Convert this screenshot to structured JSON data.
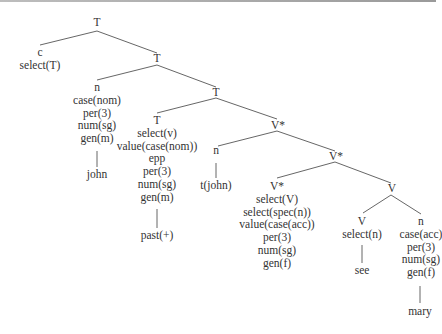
{
  "diagram": {
    "type": "syntax-tree",
    "nodes": {
      "root": {
        "label": "T"
      },
      "c": {
        "lines": [
          "c",
          "select(T)"
        ]
      },
      "t2": {
        "label": "T"
      },
      "n_subj": {
        "lines": [
          "n",
          "case(nom)",
          "per(3)",
          "num(sg)",
          "gen(m)"
        ]
      },
      "john": {
        "label": "john"
      },
      "t3": {
        "label": "T"
      },
      "t_head": {
        "lines": [
          "T",
          "select(v)",
          "value(case(nom))",
          "epp",
          "per(3)",
          "num(sg)",
          "gen(m)"
        ]
      },
      "past": {
        "label": "past(+)"
      },
      "vstar1": {
        "label": "V*"
      },
      "n_trace": {
        "label": "n"
      },
      "t_john": {
        "label": "t(john)"
      },
      "vstar2": {
        "label": "V*"
      },
      "vstar_head": {
        "lines": [
          "V*",
          "select(V)",
          "select(spec(n))",
          "value(case(acc))",
          "per(3)",
          "num(sg)",
          "gen(f)"
        ]
      },
      "v_phrase": {
        "label": "V"
      },
      "v_head": {
        "lines": [
          "V",
          "select(n)"
        ]
      },
      "see": {
        "label": "see"
      },
      "n_obj": {
        "lines": [
          "n",
          "case(acc)",
          "per(3)",
          "num(sg)",
          "gen(f)"
        ]
      },
      "mary": {
        "label": "mary"
      }
    },
    "edges": [
      [
        "root",
        "c"
      ],
      [
        "root",
        "t2"
      ],
      [
        "t2",
        "n_subj"
      ],
      [
        "t2",
        "t3"
      ],
      [
        "n_subj",
        "john"
      ],
      [
        "t3",
        "t_head"
      ],
      [
        "t3",
        "vstar1"
      ],
      [
        "t_head",
        "past"
      ],
      [
        "vstar1",
        "n_trace"
      ],
      [
        "vstar1",
        "vstar2"
      ],
      [
        "n_trace",
        "t_john"
      ],
      [
        "vstar2",
        "vstar_head"
      ],
      [
        "vstar2",
        "v_phrase"
      ],
      [
        "v_phrase",
        "v_head"
      ],
      [
        "v_phrase",
        "n_obj"
      ],
      [
        "v_head",
        "see"
      ],
      [
        "n_obj",
        "mary"
      ]
    ],
    "colors": {
      "text": "#333333",
      "edge": "#555555"
    }
  }
}
